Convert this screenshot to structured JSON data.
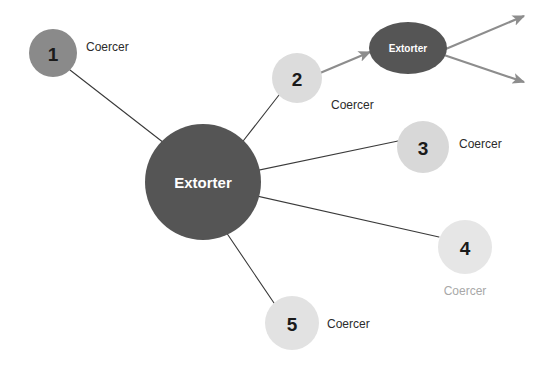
{
  "diagram": {
    "type": "network-graph",
    "background_color": "#ffffff",
    "line_color": "#3a3a3a",
    "arrow_color": "#8d8d8d",
    "hub": {
      "id": "hub-extorter",
      "label": "Extorter",
      "shape": "circle",
      "cx": 203,
      "cy": 182,
      "r": 58,
      "fill": "#555555",
      "text_color": "#ffffff",
      "font_size": 15
    },
    "secondary_hub": {
      "id": "secondary-extorter",
      "label": "Extorter",
      "shape": "ellipse",
      "cx": 408,
      "cy": 48,
      "rx": 39,
      "ry": 26,
      "fill": "#555555",
      "text_color": "#ffffff",
      "font_size": 10
    },
    "coercers": [
      {
        "id": "coercer-1",
        "number": "1",
        "label": "Coercer",
        "cx": 53,
        "cy": 53,
        "r": 24,
        "fill": "#8a8a8a",
        "number_color": "#1a1a1a",
        "number_size": 19,
        "label_color": "#2b2b2b",
        "label_size": 12,
        "label_x": 86,
        "label_y": 47,
        "label_anchor": "start"
      },
      {
        "id": "coercer-2",
        "number": "2",
        "label": "Coercer",
        "cx": 297,
        "cy": 78,
        "r": 25,
        "fill": "#dcdcdc",
        "number_color": "#1a1a1a",
        "number_size": 19,
        "label_color": "#2b2b2b",
        "label_size": 12,
        "label_x": 331,
        "label_y": 105,
        "label_anchor": "start"
      },
      {
        "id": "coercer-3",
        "number": "3",
        "label": "Coercer",
        "cx": 423,
        "cy": 147,
        "r": 26,
        "fill": "#d8d8d8",
        "number_color": "#1a1a1a",
        "number_size": 19,
        "label_color": "#2b2b2b",
        "label_size": 12,
        "label_x": 459,
        "label_y": 144,
        "label_anchor": "start"
      },
      {
        "id": "coercer-4",
        "number": "4",
        "label": "Coercer",
        "cx": 465,
        "cy": 247,
        "r": 27,
        "fill": "#e6e6e6",
        "number_color": "#1a1a1a",
        "number_size": 19,
        "label_color": "#a8a8a8",
        "label_size": 12,
        "label_x": 465,
        "label_y": 291,
        "label_anchor": "middle"
      },
      {
        "id": "coercer-5",
        "number": "5",
        "label": "Coercer",
        "cx": 292,
        "cy": 323,
        "r": 27,
        "fill": "#e2e2e2",
        "number_color": "#1a1a1a",
        "number_size": 19,
        "label_color": "#2b2b2b",
        "label_size": 12,
        "label_x": 327,
        "label_y": 324,
        "label_anchor": "start"
      }
    ],
    "edges": [
      {
        "id": "edge-hub-coercer-1",
        "from": "coercer-1",
        "to": "hub-extorter",
        "x1": 70,
        "y1": 70,
        "x2": 164,
        "y2": 143,
        "kind": "line"
      },
      {
        "id": "edge-hub-coercer-2",
        "from": "coercer-2",
        "to": "hub-extorter",
        "x1": 279,
        "y1": 95,
        "x2": 240,
        "y2": 145,
        "kind": "line"
      },
      {
        "id": "edge-hub-coercer-3",
        "from": "coercer-3",
        "to": "hub-extorter",
        "x1": 398,
        "y1": 141,
        "x2": 250,
        "y2": 172,
        "kind": "line"
      },
      {
        "id": "edge-hub-coercer-4",
        "from": "coercer-4",
        "to": "hub-extorter",
        "x1": 439,
        "y1": 237,
        "x2": 248,
        "y2": 194,
        "kind": "line"
      },
      {
        "id": "edge-hub-coercer-5",
        "from": "coercer-5",
        "to": "hub-extorter",
        "x1": 274,
        "y1": 303,
        "x2": 226,
        "y2": 232,
        "kind": "line"
      }
    ],
    "arrows": [
      {
        "id": "arrow-coercer-2-to-extorter",
        "x1": 320,
        "y1": 73,
        "x2": 370,
        "y2": 52,
        "kind": "arrow"
      },
      {
        "id": "arrow-extorter-out-upper",
        "x1": 441,
        "y1": 51,
        "x2": 524,
        "y2": 16,
        "kind": "arrow"
      },
      {
        "id": "arrow-extorter-out-lower",
        "x1": 441,
        "y1": 54,
        "x2": 524,
        "y2": 82,
        "kind": "arrow"
      }
    ]
  }
}
